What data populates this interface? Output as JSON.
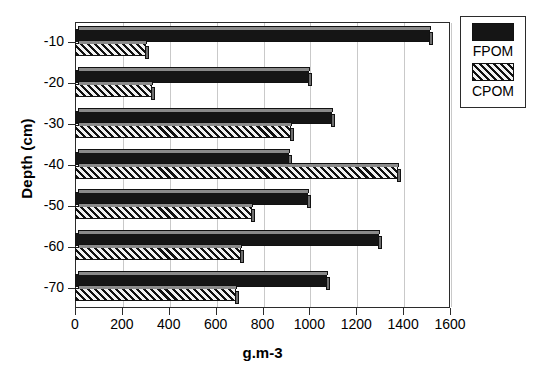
{
  "chart_data": {
    "type": "bar",
    "orientation": "horizontal",
    "title": "",
    "xlabel": "g.m-3",
    "ylabel": "Depth (cm)",
    "categories": [
      "-10",
      "-20",
      "-30",
      "-40",
      "-50",
      "-60",
      "-70"
    ],
    "series": [
      {
        "name": "FPOM",
        "color": "#151515",
        "fill": "solid",
        "values": [
          1515,
          1000,
          1095,
          915,
          995,
          1295,
          1075
        ]
      },
      {
        "name": "CPOM",
        "color": "#111111",
        "fill": "hatched",
        "values": [
          305,
          330,
          920,
          1380,
          755,
          710,
          685
        ]
      }
    ],
    "xlim": [
      0,
      1600
    ],
    "xticks": [
      "0",
      "200",
      "400",
      "600",
      "800",
      "1000",
      "1200",
      "1400",
      "1600"
    ],
    "xtick_values": [
      0,
      200,
      400,
      600,
      800,
      1000,
      1200,
      1400,
      1600
    ],
    "grid": "vertical",
    "legend_position": "top-right",
    "legend": [
      "FPOM",
      "CPOM"
    ]
  },
  "legend": {
    "entries": [
      {
        "label": "FPOM",
        "swatch": "solid-black"
      },
      {
        "label": "CPOM",
        "swatch": "hatched"
      }
    ]
  },
  "axes": {
    "x_title": "g.m-3",
    "y_title": "Depth (cm)"
  },
  "caption": {
    "text": ""
  }
}
